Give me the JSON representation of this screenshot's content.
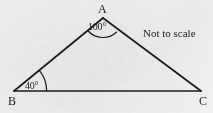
{
  "figure": {
    "type": "geometry-diagram",
    "shape": "triangle",
    "background_color": "#f2f2f2",
    "stroke_color": "#1b1b1b",
    "text_color": "#1b1b1b",
    "canvas": {
      "width": 213,
      "height": 113
    }
  },
  "vertices": [
    {
      "id": "A",
      "label": "A",
      "x": 103,
      "y": 18,
      "label_position": "above"
    },
    {
      "id": "B",
      "label": "B",
      "x": 14,
      "y": 91,
      "label_position": "below-left"
    },
    {
      "id": "C",
      "label": "C",
      "x": 201,
      "y": 91,
      "label_position": "below-right"
    }
  ],
  "edges": [
    {
      "id": "AB",
      "from": "A",
      "to": "B"
    },
    {
      "id": "AC",
      "from": "A",
      "to": "C"
    },
    {
      "id": "BC",
      "from": "B",
      "to": "C"
    }
  ],
  "angles": [
    {
      "at": "A",
      "label": "100°",
      "value": 100,
      "unit": "degrees",
      "marker": "arc"
    },
    {
      "at": "B",
      "label": "40°",
      "value": 40,
      "unit": "degrees",
      "marker": "arc"
    },
    {
      "at": "C",
      "label": "",
      "value": null,
      "unit": "degrees",
      "marker": "none"
    }
  ],
  "annotations": {
    "not_to_scale": "Not to scale"
  }
}
